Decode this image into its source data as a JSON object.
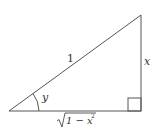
{
  "diagram": {
    "type": "right-triangle",
    "labels": {
      "hypotenuse": "1",
      "opposite": "x",
      "angle": "y",
      "adjacent_radicand_prefix": "1 − x",
      "adjacent_exponent": "2"
    },
    "stroke_color": "#555555"
  }
}
